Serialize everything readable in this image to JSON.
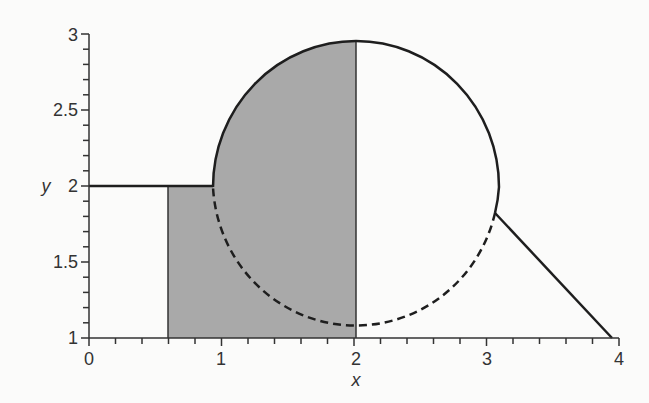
{
  "figure": {
    "x_axis": {
      "label": "x",
      "ticks": [
        "0",
        "1",
        "2",
        "3",
        "4"
      ],
      "range": [
        0,
        4
      ],
      "minor_step": 0.2
    },
    "y_axis": {
      "label": "y",
      "ticks": [
        "1",
        "1.5",
        "2",
        "2.5",
        "3"
      ],
      "range": [
        1,
        3
      ],
      "minor_step": 0.1
    },
    "colors": {
      "shade": "#a9a9a9",
      "line": "#1e1e1e",
      "axis": "#333333"
    }
  },
  "chart_data": {
    "type": "diagram",
    "title": "",
    "xlabel": "x",
    "ylabel": "y",
    "xlim": [
      0,
      4
    ],
    "ylim": [
      1,
      3
    ],
    "elements": [
      {
        "kind": "segment",
        "style": "solid",
        "from": [
          0,
          2
        ],
        "to": [
          0.92,
          2
        ]
      },
      {
        "kind": "ellipse",
        "center": [
          2,
          2
        ],
        "rx": 1.08,
        "ry": 0.96,
        "upper_part": "solid",
        "lower_part": "dashed"
      },
      {
        "kind": "segment",
        "style": "solid",
        "from": [
          3.05,
          1.83
        ],
        "to": [
          3.95,
          1
        ]
      },
      {
        "kind": "shaded_region",
        "description": "rectangle x in [0.6,2], y in [1,2] plus left half of circle above y=2",
        "x_range": [
          0.6,
          2
        ]
      },
      {
        "kind": "segment",
        "style": "thin",
        "from": [
          2,
          1
        ],
        "to": [
          2,
          2.95
        ]
      }
    ]
  }
}
